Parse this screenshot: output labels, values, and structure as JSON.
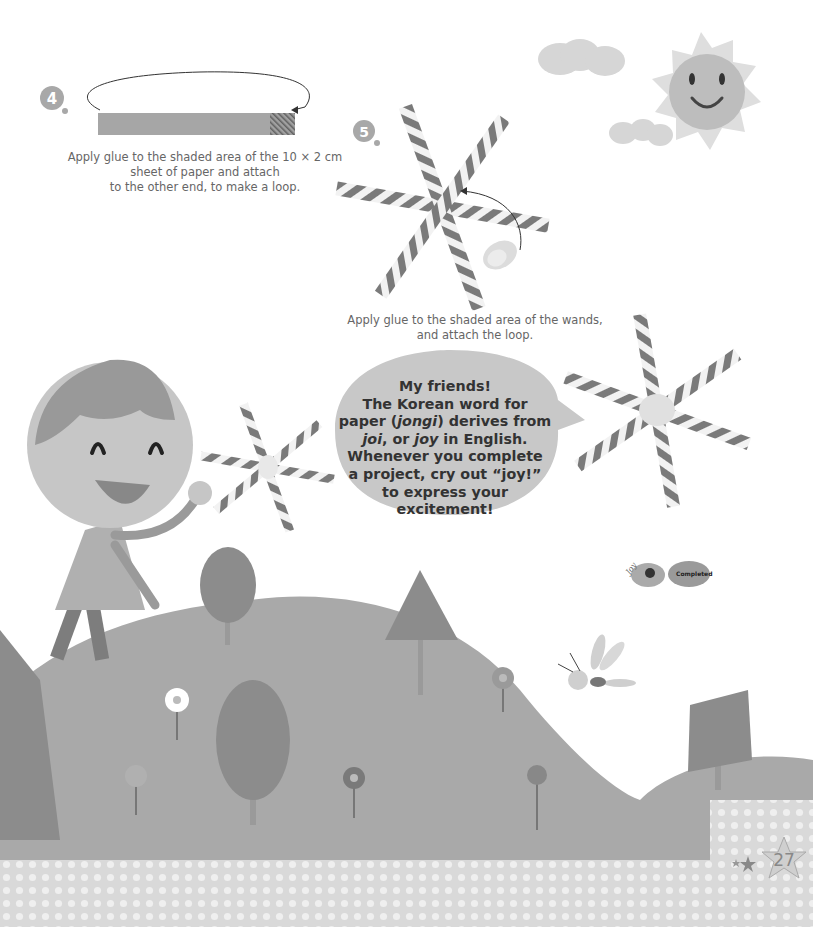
{
  "steps": [
    {
      "number": "4",
      "caption_lines": [
        "Apply glue to the shaded area of the 10 × 2 cm",
        "sheet of paper and attach",
        "to the other end, to make a loop."
      ]
    },
    {
      "number": "5",
      "caption_lines": [
        "Apply glue to the shaded area of the wands,",
        "and attach the loop."
      ]
    }
  ],
  "speech_bubble": {
    "line1": "My friends!",
    "line2": "The Korean word for",
    "line3_pre": "paper (",
    "line3_italic": "jongi",
    "line3_post": ") derives from",
    "line4_italic1": "joi",
    "line4_mid": ", or ",
    "line4_italic2": "joy",
    "line4_post": " in English.",
    "line5": "Whenever you complete",
    "line6": "a project, cry out “joy!”",
    "line7": "to express your",
    "line8": "excitement!"
  },
  "badge": {
    "joy_label": "Joy",
    "completed_label": "Completed"
  },
  "page_number": "27",
  "colors": {
    "hill": "#a8a8a8",
    "hill_light": "#b4b4b4",
    "tree": "#8c8c8c",
    "tree_mark": "#5c5c5c",
    "trunk": "#9a9a9a",
    "sky_sun": "#bdbdbd",
    "sun_rays": "#dedede",
    "cloud": "#d6d6d6",
    "stripe_dark": "#7a7a7a",
    "stripe_light": "#f2f2f2",
    "bubble": "#c8c8c8",
    "dots_bg": "#dddddd",
    "dot": "#efefef"
  }
}
